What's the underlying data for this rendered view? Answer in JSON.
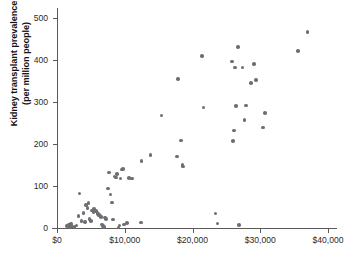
{
  "chart_data": {
    "type": "scatter",
    "title": "",
    "xlabel": "",
    "ylabel": "Kidney transplant prevalence (per million people)",
    "ylabel_line1": "Kidney transplant prevalence",
    "ylabel_line2": "(per million people)",
    "xlim": [
      0,
      42000
    ],
    "ylim": [
      0,
      520
    ],
    "grid": false,
    "legend": null,
    "marker_color": "#6e6e73",
    "axis_color": "#5a5a5a",
    "xticks": [
      {
        "value": 0,
        "label": "$0"
      },
      {
        "value": 10000,
        "label": "$10,000"
      },
      {
        "value": 20000,
        "label": "$20,000"
      },
      {
        "value": 30000,
        "label": "$30,000"
      },
      {
        "value": 40000,
        "label": "$40,000"
      }
    ],
    "yticks": [
      {
        "value": 0,
        "label": "0"
      },
      {
        "value": 100,
        "label": "100"
      },
      {
        "value": 200,
        "label": "200"
      },
      {
        "value": 300,
        "label": "300"
      },
      {
        "value": 400,
        "label": "400"
      },
      {
        "value": 500,
        "label": "500"
      }
    ],
    "points": [
      [
        1500,
        5
      ],
      [
        1750,
        8
      ],
      [
        1900,
        3
      ],
      [
        2100,
        10
      ],
      [
        2300,
        4
      ],
      [
        2600,
        2
      ],
      [
        2900,
        6
      ],
      [
        3200,
        28
      ],
      [
        3350,
        82
      ],
      [
        3600,
        16
      ],
      [
        3900,
        36
      ],
      [
        4100,
        14
      ],
      [
        4300,
        55
      ],
      [
        4500,
        47
      ],
      [
        4650,
        60
      ],
      [
        4800,
        22
      ],
      [
        5000,
        17
      ],
      [
        5200,
        42
      ],
      [
        5400,
        38
      ],
      [
        5500,
        45
      ],
      [
        5650,
        40
      ],
      [
        5800,
        41
      ],
      [
        5950,
        36
      ],
      [
        6050,
        34
      ],
      [
        6150,
        30
      ],
      [
        6300,
        32
      ],
      [
        6400,
        28
      ],
      [
        6500,
        26
      ],
      [
        6600,
        8
      ],
      [
        6750,
        5
      ],
      [
        6900,
        3
      ],
      [
        7100,
        25
      ],
      [
        7250,
        22
      ],
      [
        7500,
        94
      ],
      [
        7700,
        132
      ],
      [
        7900,
        80
      ],
      [
        8100,
        61
      ],
      [
        8300,
        20
      ],
      [
        8500,
        123
      ],
      [
        8700,
        120
      ],
      [
        8900,
        128
      ],
      [
        9050,
        1
      ],
      [
        9200,
        6
      ],
      [
        9400,
        118
      ],
      [
        9600,
        139
      ],
      [
        9750,
        140
      ],
      [
        9900,
        8
      ],
      [
        10300,
        12
      ],
      [
        10600,
        119
      ],
      [
        11100,
        118
      ],
      [
        12400,
        13
      ],
      [
        12500,
        160
      ],
      [
        13800,
        174
      ],
      [
        15400,
        268
      ],
      [
        17700,
        170
      ],
      [
        17900,
        355
      ],
      [
        18300,
        208
      ],
      [
        18500,
        150
      ],
      [
        18600,
        146
      ],
      [
        21400,
        409
      ],
      [
        21600,
        287
      ],
      [
        23400,
        35
      ],
      [
        23700,
        11
      ],
      [
        25800,
        396
      ],
      [
        26000,
        207
      ],
      [
        26100,
        232
      ],
      [
        26300,
        382
      ],
      [
        26400,
        290
      ],
      [
        26700,
        431
      ],
      [
        26900,
        7
      ],
      [
        27400,
        382
      ],
      [
        27700,
        257
      ],
      [
        27900,
        292
      ],
      [
        28600,
        345
      ],
      [
        29100,
        391
      ],
      [
        29400,
        352
      ],
      [
        30400,
        239
      ],
      [
        30700,
        274
      ],
      [
        35600,
        422
      ],
      [
        37000,
        466
      ]
    ]
  }
}
